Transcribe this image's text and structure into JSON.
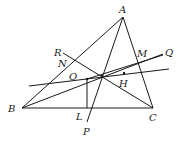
{
  "diagram": {
    "type": "geometry",
    "points": {
      "A": "A",
      "B": "B",
      "C": "C",
      "L": "L",
      "P": "P",
      "R": "R",
      "N": "N",
      "O": "O",
      "H": "H",
      "M": "M",
      "Q": "Q"
    },
    "segments": [
      [
        "A",
        "B"
      ],
      [
        "A",
        "C"
      ],
      [
        "B",
        "C"
      ],
      [
        "A",
        "P"
      ],
      [
        "O",
        "L"
      ],
      [
        "B",
        "Q"
      ],
      [
        "R",
        "C"
      ],
      [
        "O",
        "H"
      ],
      [
        "O",
        "Q"
      ]
    ],
    "ink_color": "#1a1a1a"
  }
}
